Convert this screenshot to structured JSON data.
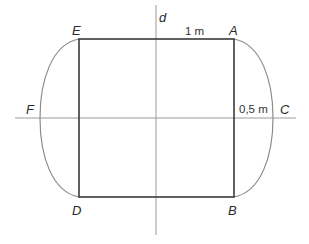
{
  "diagram": {
    "type": "geometric-figure",
    "colors": {
      "rectangle_stroke": "#3a3a3a",
      "axis_stroke": "#9a9a9a",
      "curve_stroke": "#8c8c8c",
      "label_color": "#2a2a2a"
    },
    "points": {
      "A": {
        "label": "A",
        "x": 234,
        "y": 39
      },
      "B": {
        "label": "B",
        "x": 234,
        "y": 197
      },
      "D": {
        "label": "D",
        "x": 79,
        "y": 197
      },
      "E": {
        "label": "E",
        "x": 79,
        "y": 39
      },
      "C": {
        "label": "C",
        "x": 273,
        "y": 118
      },
      "F": {
        "label": "F",
        "x": 40,
        "y": 118
      }
    },
    "axis_label": "d",
    "measurements": {
      "top_segment": "1 m",
      "right_offset": "0,5 m"
    }
  }
}
